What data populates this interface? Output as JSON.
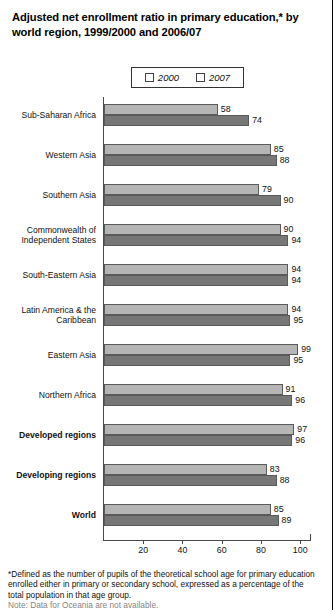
{
  "title": "Adjusted net enrollment ratio in primary education,* by world region, 1999/2000 and 2006/07",
  "legend": {
    "series_2000_label": "2000",
    "series_2007_label": "2007",
    "color_2000": "#b5b5b5",
    "color_2007": "#777777"
  },
  "footnote": {
    "line1": "*Defined as the number of pupils of the theoretical school age for primary education enrolled either in primary or secondary school, expressed as a percentage of the total population in that age group.",
    "line_clipped": "Note: Data for Oceania are not available."
  },
  "chart_data": {
    "type": "bar",
    "orientation": "horizontal",
    "title": "Adjusted net enrollment ratio in primary education,* by world region, 1999/2000 and 2006/07",
    "xlabel": "",
    "ylabel": "",
    "xlim": [
      0,
      105
    ],
    "xticks": [
      20,
      40,
      60,
      80,
      100
    ],
    "grid": false,
    "legend_position": "top-center",
    "categories": [
      "Sub-Saharan Africa",
      "Western Asia",
      "Southern Asia",
      "Commonwealth of Independent States",
      "South-Eastern Asia",
      "Latin America & the Caribbean",
      "Eastern Asia",
      "Northern Africa",
      "Developed regions",
      "Developing regions",
      "World"
    ],
    "categories_display": [
      [
        "Sub-Saharan Africa"
      ],
      [
        "Western Asia"
      ],
      [
        "Southern Asia"
      ],
      [
        "Commonwealth of",
        "Independent States"
      ],
      [
        "South-Eastern Asia"
      ],
      [
        "Latin America & the",
        "Caribbean"
      ],
      [
        "Eastern Asia"
      ],
      [
        "Northern Africa"
      ],
      [
        "Developed regions"
      ],
      [
        "Developing regions"
      ],
      [
        "World"
      ]
    ],
    "categories_bold": [
      false,
      false,
      false,
      false,
      false,
      false,
      false,
      false,
      true,
      true,
      true
    ],
    "series": [
      {
        "name": "2000",
        "values": [
          58,
          85,
          79,
          90,
          94,
          94,
          99,
          91,
          97,
          83,
          85
        ]
      },
      {
        "name": "2007",
        "values": [
          74,
          88,
          90,
          94,
          94,
          95,
          95,
          96,
          96,
          88,
          89
        ]
      }
    ]
  }
}
